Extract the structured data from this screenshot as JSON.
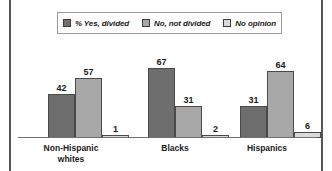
{
  "chart_data": {
    "type": "bar",
    "title": "",
    "subtitle": "",
    "xlabel": "",
    "ylabel": "",
    "ylim": [
      0,
      100
    ],
    "grid": false,
    "legend_position": "top-center",
    "categories": [
      "Non-Hispanic whites",
      "Blacks",
      "Hispanics"
    ],
    "category_lines": [
      [
        "Non-Hispanic",
        "whites"
      ],
      [
        "Blacks"
      ],
      [
        "Hispanics"
      ]
    ],
    "series": [
      {
        "name": "% Yes, divided",
        "color": "#6e6e6e",
        "values": [
          42,
          67,
          31
        ]
      },
      {
        "name": "No, not divided",
        "color": "#a8a8a8",
        "values": [
          57,
          31,
          64
        ]
      },
      {
        "name": "No opinion",
        "color": "#d9d9d9",
        "values": [
          1,
          2,
          6
        ]
      }
    ],
    "value_labels": [
      [
        "42",
        "57",
        "1"
      ],
      [
        "67",
        "31",
        "2"
      ],
      [
        "31",
        "64",
        "6"
      ]
    ],
    "max_value": 67,
    "axis_color": "#6d6f72",
    "bar_outline_color": "#4a4a4a",
    "frame_rule_color": "#54565a",
    "legend_border_color": "#9a9a9a",
    "background": "#ffffff"
  },
  "legend": {
    "items": [
      {
        "label": "% Yes, divided",
        "color": "#6e6e6e"
      },
      {
        "label": "No, not divided",
        "color": "#a8a8a8"
      },
      {
        "label": "No opinion",
        "color": "#d9d9d9"
      }
    ]
  }
}
